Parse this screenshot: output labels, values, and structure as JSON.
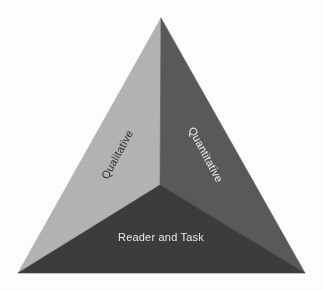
{
  "figure": {
    "type": "triangle-diagram",
    "background_color": "#ffffff",
    "width": 323,
    "height": 290,
    "geometry": {
      "apex": [
        161,
        18
      ],
      "bottom_left": [
        18,
        273
      ],
      "bottom_right": [
        305,
        273
      ],
      "center_junction": [
        160,
        185
      ]
    },
    "faces": [
      {
        "id": "left",
        "label": "Qualitative",
        "fill_color": "#b4b4b4",
        "text_color": "#2b2b2b",
        "rotation_deg": -61,
        "label_center": [
          118,
          155
        ],
        "font_size": 11
      },
      {
        "id": "right",
        "label": "Quantitative",
        "fill_color": "#5a5a5a",
        "text_color": "#f2f2f2",
        "rotation_deg": 62,
        "label_center": [
          205,
          155
        ],
        "font_size": 11
      },
      {
        "id": "bottom",
        "label": "Reader and Task",
        "fill_color": "#3c3c3c",
        "text_color": "#eaeaea",
        "rotation_deg": 0,
        "label_center": [
          161,
          238
        ],
        "font_size": 11
      }
    ]
  }
}
